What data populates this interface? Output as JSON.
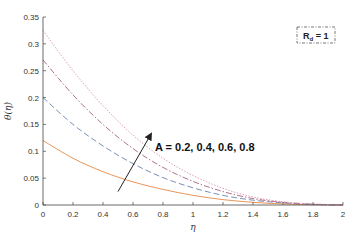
{
  "chart_data": {
    "type": "line",
    "title": "",
    "xlabel": "η",
    "ylabel": "θ(η)",
    "xlim": [
      0,
      2
    ],
    "ylim": [
      0,
      0.35
    ],
    "grid": false,
    "xticks": [
      0,
      0.2,
      0.4,
      0.6,
      0.8,
      1,
      1.2,
      1.4,
      1.6,
      1.8,
      2
    ],
    "xtick_labels": [
      "0",
      "0.2",
      "0.4",
      "0.6",
      "0.8",
      "1",
      "1.2",
      "1.4",
      "1.6",
      "1.8",
      "2"
    ],
    "yticks": [
      0,
      0.05,
      0.1,
      0.15,
      0.2,
      0.25,
      0.3,
      0.35
    ],
    "ytick_labels": [
      "0",
      "0.05",
      "0.1",
      "0.15",
      "0.2",
      "0.25",
      "0.3",
      "0.35"
    ],
    "x": [
      0,
      0.2,
      0.4,
      0.6,
      0.8,
      1.0,
      1.2,
      1.4,
      1.6,
      1.8,
      2.0
    ],
    "series": [
      {
        "name": "A = 0.2",
        "color": "#e8965a",
        "dash": "",
        "values": [
          0.12,
          0.087,
          0.062,
          0.043,
          0.029,
          0.018,
          0.01,
          0.005,
          0.002,
          0.0005,
          0
        ]
      },
      {
        "name": "A = 0.4",
        "color": "#7a8fb8",
        "dash": "6,3",
        "values": [
          0.2,
          0.15,
          0.11,
          0.077,
          0.051,
          0.032,
          0.018,
          0.009,
          0.004,
          0.001,
          0
        ]
      },
      {
        "name": "A = 0.6",
        "color": "#b07090",
        "dash": "6,2,1.5,2",
        "values": [
          0.27,
          0.205,
          0.15,
          0.105,
          0.07,
          0.044,
          0.025,
          0.012,
          0.005,
          0.0015,
          0
        ]
      },
      {
        "name": "A = 0.8",
        "color": "#e0a0b8",
        "dash": "1.5,1.5",
        "values": [
          0.325,
          0.25,
          0.185,
          0.13,
          0.087,
          0.055,
          0.031,
          0.015,
          0.006,
          0.002,
          0
        ]
      }
    ],
    "annotations": [
      {
        "text": "A = 0.2, 0.4, 0.6, 0.8",
        "arrow_from": [
          0.5,
          0.025
        ],
        "arrow_to": [
          0.72,
          0.132
        ],
        "text_pos": [
          0.75,
          0.135
        ]
      }
    ],
    "legend": {
      "text_main": "R",
      "text_sub": "d",
      "text_rest": " = 1",
      "position": "top-right"
    }
  }
}
